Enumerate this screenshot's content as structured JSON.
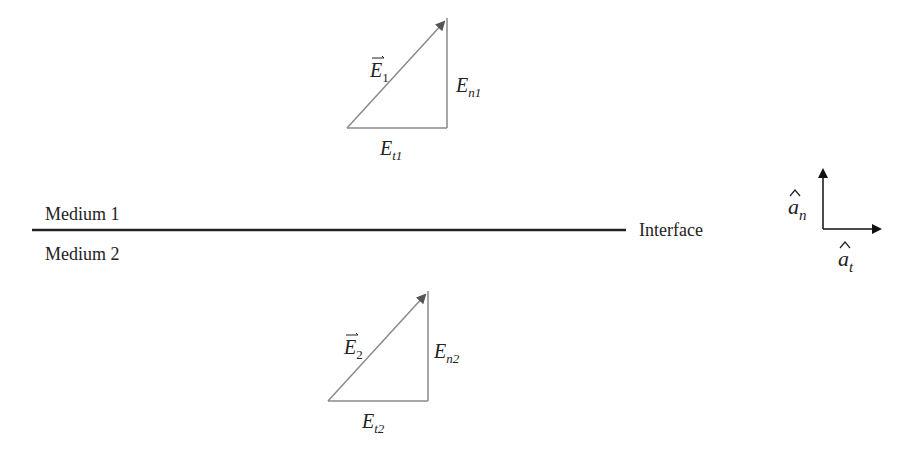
{
  "diagram": {
    "media": {
      "medium1_label": "Medium 1",
      "medium2_label": "Medium 2",
      "interface_label": "Interface"
    },
    "triangle1": {
      "vector_symbol": "E",
      "vector_subscript": "1",
      "normal_symbol": "E",
      "normal_subscript": "n1",
      "tangential_symbol": "E",
      "tangential_subscript": "t1"
    },
    "triangle2": {
      "vector_symbol": "E",
      "vector_subscript": "2",
      "normal_symbol": "E",
      "normal_subscript": "n2",
      "tangential_symbol": "E",
      "tangential_subscript": "t2"
    },
    "axes": {
      "normal_symbol": "a",
      "normal_subscript": "n",
      "tangential_symbol": "a",
      "tangential_subscript": "t"
    },
    "colors": {
      "triangle_stroke": "#8a8a8a",
      "arrow_fill": "#555555",
      "interface_line": "#222222",
      "text": "#222222"
    }
  }
}
